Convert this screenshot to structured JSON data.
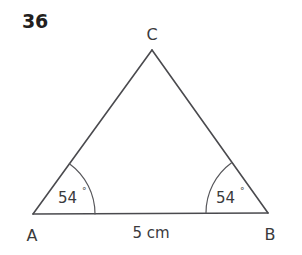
{
  "figure": {
    "problem_number": "36",
    "shape": "triangle",
    "background_color": "#ffffff",
    "line_color": "#4a4a4e",
    "text_color": "#3a3a3c"
  },
  "vertices": [
    {
      "name": "A",
      "label": "A",
      "x": 33,
      "y": 214
    },
    {
      "name": "B",
      "label": "B",
      "x": 268,
      "y": 213
    },
    {
      "name": "C",
      "label": "C",
      "x": 152,
      "y": 50
    }
  ],
  "labels": {
    "vertex_a": "A",
    "vertex_b": "B",
    "vertex_c": "C"
  },
  "angles": [
    {
      "at": "A",
      "value": "54",
      "degree_symbol": "°",
      "full": "54°"
    },
    {
      "at": "B",
      "value": "54",
      "degree_symbol": "°",
      "full": "54°"
    }
  ],
  "sides": [
    {
      "from": "A",
      "to": "B",
      "label": "5 cm",
      "length_value": "5",
      "unit": "cm"
    }
  ]
}
